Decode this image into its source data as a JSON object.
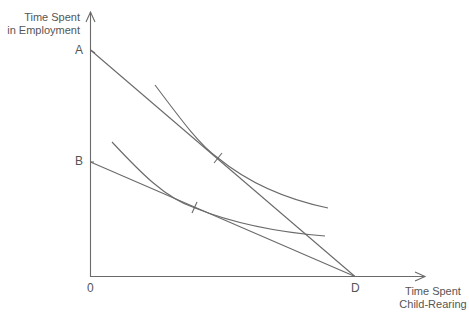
{
  "diagram": {
    "y_axis_label_line1": "Time Spent",
    "y_axis_label_line2": "in Employment",
    "x_axis_label_line1": "Time Spent",
    "x_axis_label_line2": "Child-Rearing",
    "point_labels": {
      "A": "A",
      "B": "B",
      "origin": "0",
      "D": "D"
    },
    "colors": {
      "line": "#6a6a6a",
      "text": "#555555"
    },
    "elements": {
      "budget_lines": [
        "AD",
        "BD"
      ],
      "indifference_curves": 2,
      "tangency_marks": 2
    }
  }
}
